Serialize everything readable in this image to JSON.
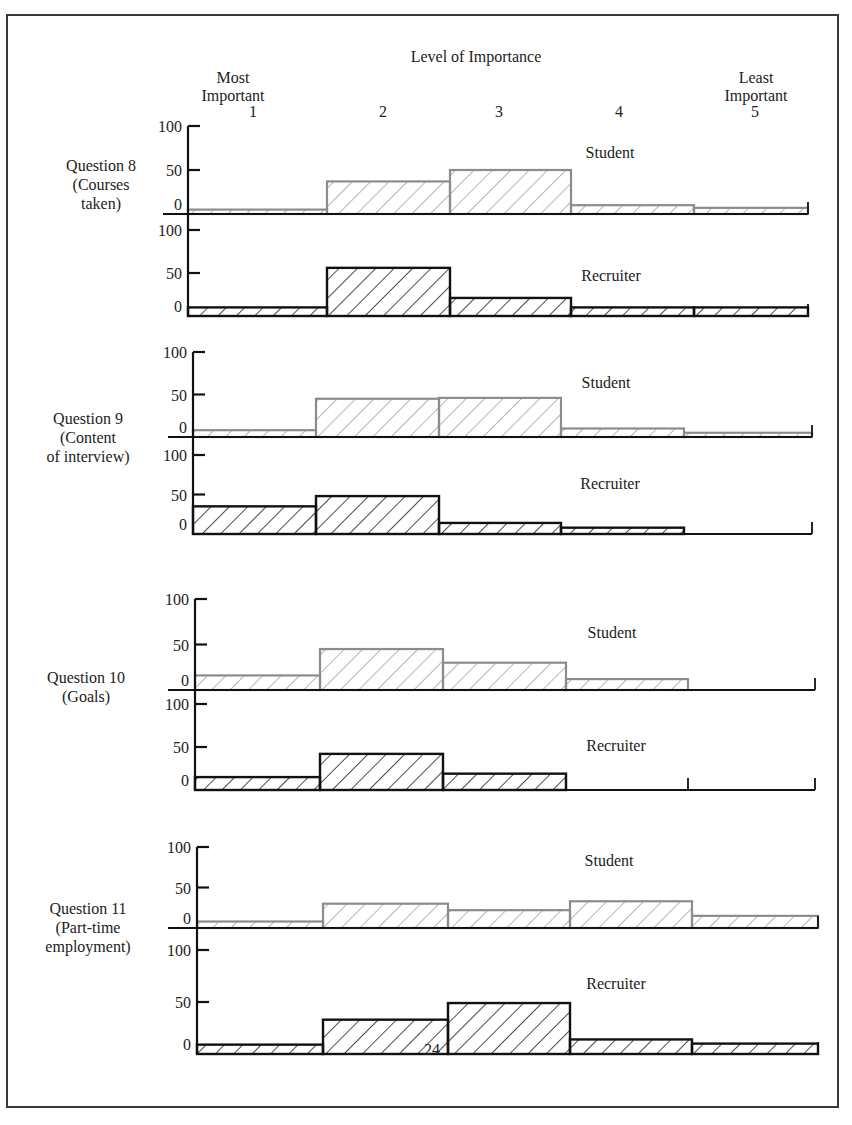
{
  "header": {
    "title": "Level of Importance",
    "most_line1": "Most",
    "most_line2": "Important",
    "least_line1": "Least",
    "least_line2": "Important",
    "levels": [
      "1",
      "2",
      "3",
      "4",
      "5"
    ]
  },
  "axis": {
    "tick_labels": [
      "100",
      "50",
      "0"
    ]
  },
  "series_labels": {
    "student": "Student",
    "recruiter": "Recruiter"
  },
  "colors": {
    "student": "#8c8c8c",
    "recruiter": "#111111",
    "baseline": "#111111"
  },
  "questions": [
    {
      "label_lines": [
        "Question 8",
        "(Courses",
        "taken)"
      ]
    },
    {
      "label_lines": [
        "Question 9",
        "(Content",
        "of interview)"
      ]
    },
    {
      "label_lines": [
        "Question 10",
        "(Goals)"
      ]
    },
    {
      "label_lines": [
        "Question 11",
        "(Part-time",
        "employment)"
      ]
    }
  ],
  "footer": {
    "page_number": "24"
  },
  "chart_data": {
    "type": "bar",
    "title": "Level of Importance",
    "xlabel": "Level of Importance (1 = Most Important, 5 = Least Important)",
    "ylabel": "",
    "categories": [
      "1",
      "2",
      "3",
      "4",
      "5"
    ],
    "ylim": [
      0,
      100
    ],
    "yticks": [
      0,
      50,
      100
    ],
    "grid": false,
    "legend": "inline labels 'Student' and 'Recruiter' per panel",
    "panels": [
      {
        "question": "Question 8 (Courses taken)",
        "series": [
          {
            "name": "Student",
            "values": [
              5,
              37,
              50,
              10,
              7
            ]
          },
          {
            "name": "Recruiter",
            "values": [
              10,
              56,
              21,
              10,
              10
            ]
          }
        ]
      },
      {
        "question": "Question 9 (Content of interview)",
        "series": [
          {
            "name": "Student",
            "values": [
              8,
              45,
              46,
              10,
              5
            ]
          },
          {
            "name": "Recruiter",
            "values": [
              35,
              48,
              14,
              8,
              0
            ]
          }
        ]
      },
      {
        "question": "Question 10 (Goals)",
        "series": [
          {
            "name": "Student",
            "values": [
              16,
              45,
              30,
              12,
              0
            ]
          },
          {
            "name": "Recruiter",
            "values": [
              15,
              42,
              19,
              0,
              0
            ]
          }
        ]
      },
      {
        "question": "Question 11 (Part-time employment)",
        "series": [
          {
            "name": "Student",
            "values": [
              8,
              30,
              22,
              33,
              15
            ]
          },
          {
            "name": "Recruiter",
            "values": [
              9,
              33,
              49,
              14,
              10
            ]
          }
        ]
      }
    ]
  }
}
